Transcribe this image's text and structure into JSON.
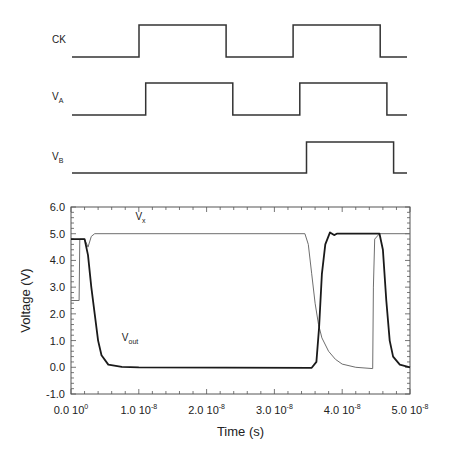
{
  "chart_data": [
    {
      "type": "line",
      "title": "Digital timing waveforms",
      "x_range": [
        0,
        5e-08
      ],
      "series": [
        {
          "name": "CK",
          "label_main": "CK",
          "label_sub": "",
          "levels": "low/high",
          "points": [
            [
              0,
              0
            ],
            [
              1e-08,
              0
            ],
            [
              1e-08,
              1
            ],
            [
              2.3e-08,
              1
            ],
            [
              2.3e-08,
              0
            ],
            [
              3.3e-08,
              0
            ],
            [
              3.3e-08,
              1
            ],
            [
              4.6e-08,
              1
            ],
            [
              4.6e-08,
              0
            ],
            [
              5e-08,
              0
            ]
          ]
        },
        {
          "name": "V_A",
          "label_main": "V",
          "label_sub": "A",
          "levels": "low/high",
          "points": [
            [
              0,
              0
            ],
            [
              1.1e-08,
              0
            ],
            [
              1.1e-08,
              1
            ],
            [
              2.4e-08,
              1
            ],
            [
              2.4e-08,
              0
            ],
            [
              3.4e-08,
              0
            ],
            [
              3.4e-08,
              1
            ],
            [
              4.7e-08,
              1
            ],
            [
              4.7e-08,
              0
            ],
            [
              5e-08,
              0
            ]
          ]
        },
        {
          "name": "V_B",
          "label_main": "V",
          "label_sub": "B",
          "levels": "low/high",
          "points": [
            [
              0,
              0
            ],
            [
              3.5e-08,
              0
            ],
            [
              3.5e-08,
              1
            ],
            [
              4.8e-08,
              1
            ],
            [
              4.8e-08,
              0
            ],
            [
              5e-08,
              0
            ]
          ]
        }
      ]
    },
    {
      "type": "line",
      "title": "",
      "xlabel": "Time (s)",
      "ylabel": "Voltage (V)",
      "xlim": [
        0,
        5e-08
      ],
      "ylim": [
        -1.0,
        6.0
      ],
      "grid": false,
      "x_ticks": [
        {
          "value": 0,
          "mantissa": "0.0",
          "base": "10",
          "exp": "0"
        },
        {
          "value": 1e-08,
          "mantissa": "1.0",
          "base": "10",
          "exp": "-8"
        },
        {
          "value": 2e-08,
          "mantissa": "2.0",
          "base": "10",
          "exp": "-8"
        },
        {
          "value": 3e-08,
          "mantissa": "3.0",
          "base": "10",
          "exp": "-8"
        },
        {
          "value": 4e-08,
          "mantissa": "4.0",
          "base": "10",
          "exp": "-8"
        },
        {
          "value": 5e-08,
          "mantissa": "5.0",
          "base": "10",
          "exp": "-8"
        }
      ],
      "y_ticks": [
        {
          "value": 6.0,
          "label": "6.0"
        },
        {
          "value": 5.0,
          "label": "5.0"
        },
        {
          "value": 4.0,
          "label": "4.0"
        },
        {
          "value": 3.0,
          "label": "3.0"
        },
        {
          "value": 2.0,
          "label": "2.0"
        },
        {
          "value": 1.0,
          "label": "1.0"
        },
        {
          "value": 0.0,
          "label": "0.0"
        },
        {
          "value": -1.0,
          "label": "-1.0"
        }
      ],
      "series": [
        {
          "name": "V_x",
          "label_main": "V",
          "label_sub": "x",
          "label_at": [
            9.5e-09,
            5.5
          ],
          "style": "thin",
          "color": "#6e6e6e",
          "points": [
            [
              0,
              2.5
            ],
            [
              1.2e-09,
              2.5
            ],
            [
              1.3e-09,
              4.8
            ],
            [
              2e-09,
              4.8
            ],
            [
              2.5e-09,
              4.5
            ],
            [
              3e-09,
              4.9
            ],
            [
              3.5e-09,
              5.0
            ],
            [
              3.45e-08,
              5.0
            ],
            [
              3.5e-08,
              4.6
            ],
            [
              3.55e-08,
              3.5
            ],
            [
              3.6e-08,
              2.4
            ],
            [
              3.65e-08,
              1.6
            ],
            [
              3.7e-08,
              1.1
            ],
            [
              3.8e-08,
              0.6
            ],
            [
              3.9e-08,
              0.3
            ],
            [
              4e-08,
              0.12
            ],
            [
              4.2e-08,
              0.0
            ],
            [
              4.45e-08,
              -0.05
            ],
            [
              4.46e-08,
              3.0
            ],
            [
              4.48e-08,
              4.8
            ],
            [
              4.55e-08,
              5.0
            ],
            [
              5e-08,
              5.0
            ]
          ]
        },
        {
          "name": "V_out",
          "label_main": "V",
          "label_sub": "out",
          "label_at": [
            7.5e-09,
            1.0
          ],
          "style": "thick",
          "color": "#1a1a1a",
          "points": [
            [
              0,
              4.8
            ],
            [
              2e-09,
              4.8
            ],
            [
              2.5e-09,
              4.2
            ],
            [
              3e-09,
              3.0
            ],
            [
              3.5e-09,
              2.0
            ],
            [
              4e-09,
              1.0
            ],
            [
              4.5e-09,
              0.45
            ],
            [
              5.5e-09,
              0.1
            ],
            [
              7.5e-09,
              0.02
            ],
            [
              1e-08,
              0.0
            ],
            [
              3.55e-08,
              -0.02
            ],
            [
              3.62e-08,
              0.2
            ],
            [
              3.66e-08,
              1.5
            ],
            [
              3.7e-08,
              3.5
            ],
            [
              3.75e-08,
              4.6
            ],
            [
              3.82e-08,
              5.05
            ],
            [
              3.88e-08,
              4.95
            ],
            [
              3.92e-08,
              5.0
            ],
            [
              3.97e-08,
              5.0
            ],
            [
              4.55e-08,
              5.0
            ],
            [
              4.6e-08,
              4.4
            ],
            [
              4.65e-08,
              2.5
            ],
            [
              4.7e-08,
              1.0
            ],
            [
              4.75e-08,
              0.4
            ],
            [
              4.85e-08,
              0.1
            ],
            [
              5e-08,
              0.0
            ]
          ]
        }
      ]
    }
  ]
}
